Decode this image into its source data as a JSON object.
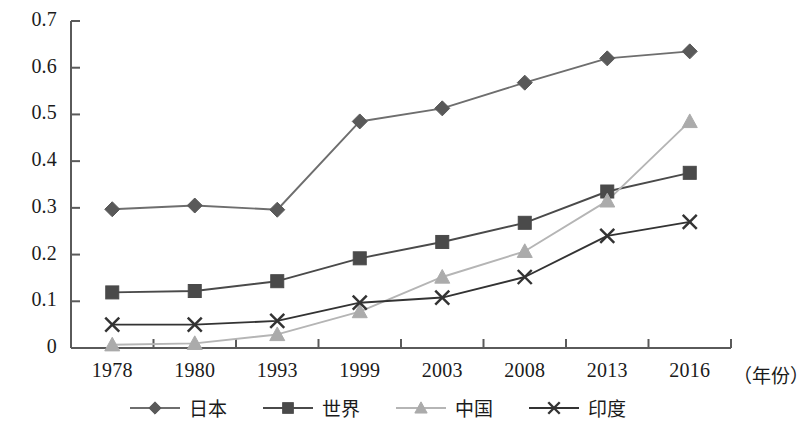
{
  "chart_data": {
    "type": "line",
    "title": "",
    "subtitle": "",
    "xlabel": "（年份）",
    "ylabel": "",
    "categories": [
      "1978",
      "1980",
      "1993",
      "1999",
      "2003",
      "2008",
      "2013",
      "2016"
    ],
    "ylim": [
      0,
      0.7
    ],
    "ytick_labels": [
      "0",
      "0.1",
      "0.2",
      "0.3",
      "0.4",
      "0.5",
      "0.6",
      "0.7"
    ],
    "ytick_values": [
      0,
      0.1,
      0.2,
      0.3,
      0.4,
      0.5,
      0.6,
      0.7
    ],
    "grid": false,
    "legend_position": "bottom",
    "series": [
      {
        "name": "日本",
        "marker": "diamond",
        "color": "#595959",
        "line_color": "#6e6e6e",
        "values": [
          0.297,
          0.305,
          0.296,
          0.485,
          0.513,
          0.568,
          0.62,
          0.635
        ]
      },
      {
        "name": "世界",
        "marker": "square",
        "color": "#4a4a4a",
        "line_color": "#4a4a4a",
        "values": [
          0.119,
          0.122,
          0.143,
          0.192,
          0.227,
          0.268,
          0.335,
          0.375
        ]
      },
      {
        "name": "中国",
        "marker": "triangle",
        "color": "#ababab",
        "line_color": "#b5b5b5",
        "values": [
          0.007,
          0.01,
          0.029,
          0.078,
          0.152,
          0.207,
          0.315,
          0.485
        ]
      },
      {
        "name": "印度",
        "marker": "x",
        "color": "#333333",
        "line_color": "#333333",
        "values": [
          0.05,
          0.05,
          0.058,
          0.097,
          0.108,
          0.152,
          0.24,
          0.27
        ]
      }
    ]
  },
  "axis": {
    "axis_color": "#5a5a5a",
    "tick_color": "#5a5a5a"
  }
}
